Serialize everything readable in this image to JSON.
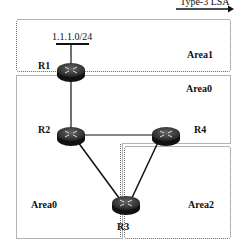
{
  "legend": {
    "label": "Type-3 LSA",
    "arrow": "right-arrow"
  },
  "network": {
    "prefix": "1.1.1.0/24"
  },
  "areas": [
    {
      "id": "area1",
      "label": "Area1"
    },
    {
      "id": "area0-top",
      "label": "Area0"
    },
    {
      "id": "area0-bottom",
      "label": "Area0"
    },
    {
      "id": "area2",
      "label": "Area2"
    }
  ],
  "routers": [
    {
      "id": "R1",
      "label": "R1"
    },
    {
      "id": "R2",
      "label": "R2"
    },
    {
      "id": "R3",
      "label": "R3"
    },
    {
      "id": "R4",
      "label": "R4"
    }
  ],
  "links": [
    [
      "R1",
      "R2"
    ],
    [
      "R2",
      "R4"
    ],
    [
      "R2",
      "R3"
    ],
    [
      "R4",
      "R3"
    ]
  ],
  "colors": {
    "line": "#111111",
    "router_top": "#3a3a3a",
    "router_side": "#111111",
    "border": "#555555"
  }
}
